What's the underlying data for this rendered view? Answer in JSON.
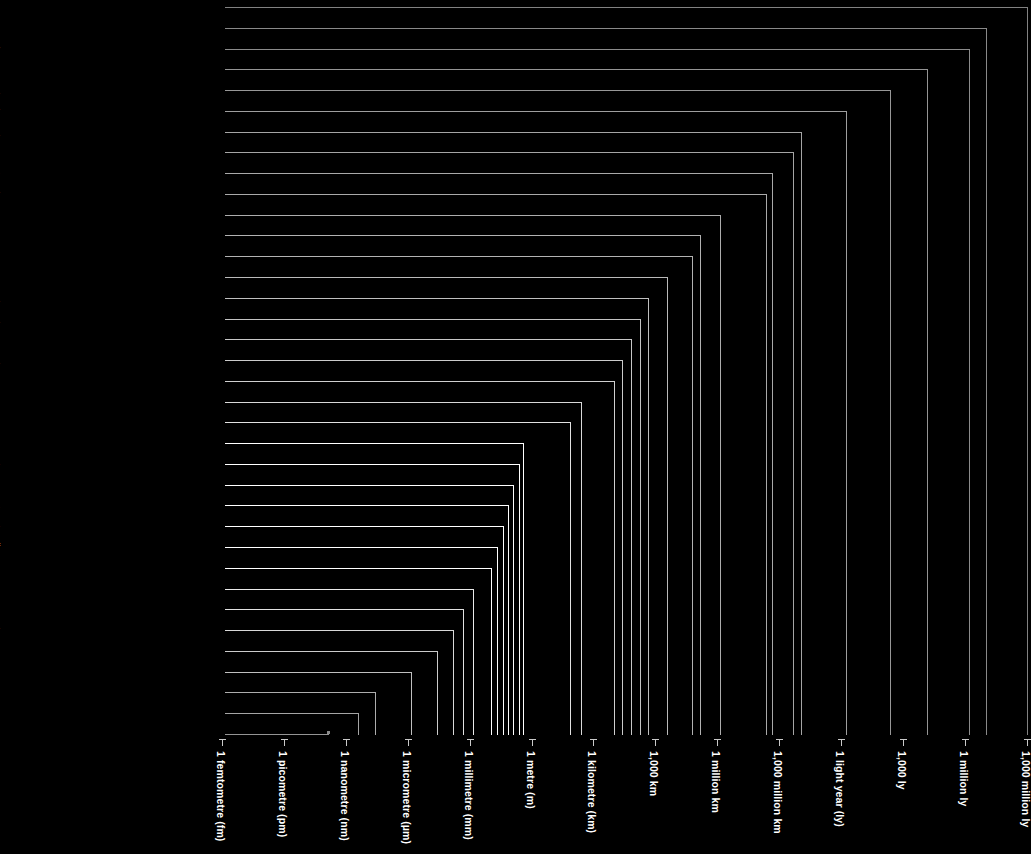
{
  "chart_data": {
    "type": "bar",
    "title": "",
    "subtitle": "",
    "xlabel": "",
    "ylabel": "",
    "orientation": "horizontal-log-scale",
    "grid": false,
    "legend": null,
    "axis_ticks": [
      "1 femtometre (fm)",
      "1 picometre (pm)",
      "1 nanometre (nm)",
      "1 micrometre (µm)",
      "1 millimetre (mm)",
      "1 metre (m)",
      "1 kilometre (km)",
      "1,000 km",
      "1 million km",
      "1,000 million km",
      "1 light year (ly)",
      "1,000 ly",
      "1 million ly",
      "1,000 million ly"
    ],
    "categories": [
      "Distance to Quasar 1007 + 417",
      "Distance to Centauras A",
      "Distance to the Andromeda Galaxy",
      "Distance to Tucanae 47",
      "Distance to the Helix Nebula",
      "Distance to Alcor in the Big Dipper",
      "Diameter of the Ring Nebula",
      "Diameter of the Solar System",
      "Distance to Pluto",
      "Distance to Jupiter",
      "Distance to the Sun",
      "Diameter of the Sun",
      "Distance to the Moon",
      "Diameter of Earth",
      "Distance across Antarctica",
      "Length of the Horn of Africa",
      "Length of the B15 Iceberg",
      "Length of the Nile Delta",
      "Distance across Paris",
      "Width of Uluru (Ayers Rock)",
      "Width of the River Thames in London",
      "Length of a human lung",
      "Length of a European mole",
      "Size of a deep-sea Angler fish",
      "Length of a human fetus at 3 months",
      "Width of a heart valve",
      "Size of a Venus flytrap leaf",
      "Length of a clover seed",
      "Width of a housefly's eye",
      "Length of a shark scale",
      "Thickness of a hair",
      "Diameter of a Knotweed pollen grain",
      "Length of an E.coli bacterium",
      "Size of Hepatitis B virus particles",
      "Width of a DNA molecule",
      "Approximate diameter of a gold atom"
    ],
    "bar_end_px": [
      1027,
      986,
      969,
      927,
      890,
      846,
      801,
      793,
      772,
      766,
      720,
      700,
      692,
      667,
      648,
      640,
      631,
      622,
      614,
      581,
      570,
      523,
      519,
      513,
      508,
      503,
      497,
      491,
      473,
      463,
      453,
      437,
      411,
      375,
      358,
      328
    ],
    "bar_brightness": [
      0.42,
      0.45,
      0.46,
      0.5,
      0.52,
      0.55,
      0.58,
      0.58,
      0.6,
      0.6,
      0.62,
      0.64,
      0.64,
      0.68,
      0.7,
      0.72,
      0.74,
      0.76,
      0.78,
      0.82,
      0.86,
      1.0,
      1.0,
      1.0,
      1.0,
      1.0,
      1.0,
      1.0,
      0.9,
      0.86,
      0.82,
      0.76,
      0.7,
      0.62,
      0.58,
      0.5
    ],
    "bold_rows": [
      21,
      22,
      23,
      24,
      25,
      26,
      27
    ]
  },
  "layout": {
    "axis_origin_x": 222,
    "tick_spacing_px": 61.9,
    "baseline_y": 735,
    "first_row_y": 7,
    "row_spacing_px": 20.77,
    "label_right_edge_px": 218,
    "leader_start_px": 225
  },
  "colors": {
    "background": "#000000",
    "label_dim": "#9a9a9a",
    "label_highlight": "#ffffff",
    "axis": "#c9c9c9"
  }
}
